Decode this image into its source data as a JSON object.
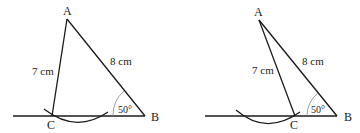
{
  "figures": [
    {
      "id": "left",
      "points": {
        "A": "A",
        "B": "B",
        "C": "C"
      },
      "side_AC": "7 cm",
      "side_AB": "8 cm",
      "angle_B": "50°"
    },
    {
      "id": "right",
      "points": {
        "A": "A",
        "B": "B",
        "C": "C"
      },
      "side_AC": "7 cm",
      "side_AB": "8 cm",
      "angle_B": "50°"
    }
  ],
  "colors": {
    "stroke": "#1a1a1a",
    "angle_arc": "#888888"
  }
}
